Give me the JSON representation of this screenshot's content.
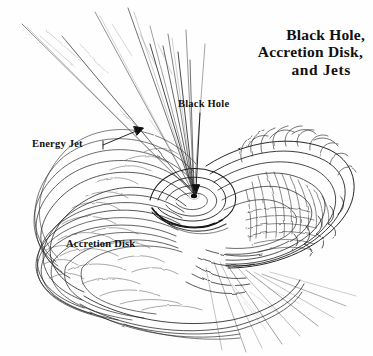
{
  "figure": {
    "kind": "hand-drawn pen-and-ink astronomical diagram",
    "background_color": "#fefefe",
    "ink_color": "#1a1a1a",
    "width": 373,
    "height": 356
  },
  "title": {
    "line1": "Black Hole,",
    "line2": "Accretion Disk,",
    "line3": "and Jets"
  },
  "labels": {
    "black_hole": "Black Hole",
    "energy_jet": "Energy Jet",
    "accretion_disk": "Accretion Disk"
  },
  "annotations": [
    {
      "name": "black-hole-leader",
      "label": "Black Hole",
      "from": [
        188,
        112
      ],
      "to": [
        196,
        193
      ]
    },
    {
      "name": "energy-jet-leader",
      "label": "Energy Jet",
      "from": [
        108,
        145
      ],
      "to": [
        140,
        130
      ]
    }
  ],
  "features": {
    "singularity": {
      "name": "black-hole-core",
      "center": [
        194,
        196
      ],
      "radius": 3
    },
    "jet_upper_left": {
      "name": "energy-jet-upper",
      "direction": "upper-left",
      "ray_count": 9
    },
    "jet_lower_right": {
      "name": "counter-jet-lower",
      "direction": "lower-right",
      "ray_count": 8
    },
    "disk": {
      "name": "accretion-disk",
      "center": [
        190,
        200
      ],
      "tilt_deg": -20
    }
  }
}
